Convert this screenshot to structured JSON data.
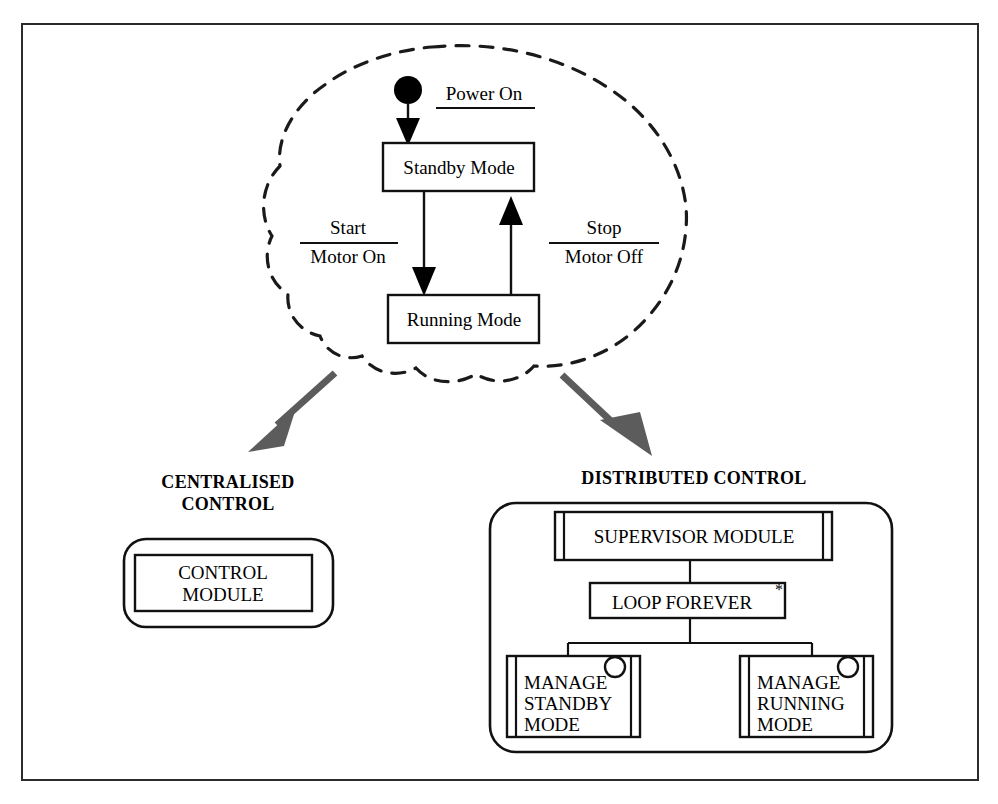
{
  "diagram": {
    "frame": {
      "present": true,
      "color": "#2b2b2b"
    },
    "colors": {
      "line": "#111111",
      "cloud": "#1a1a1a",
      "arrow_gray": "#5c5c5c",
      "background": "#ffffff"
    },
    "statechart": {
      "container_style": "cloud-dashed",
      "initial_node": "filled-circle",
      "states": [
        {
          "id": "standby",
          "label": "Standby Mode"
        },
        {
          "id": "running",
          "label": "Running Mode"
        }
      ],
      "transitions": [
        {
          "id": "power-on",
          "from": "initial",
          "to": "standby",
          "trigger": "Power On",
          "action": "",
          "has_rule": true
        },
        {
          "id": "start",
          "from": "standby",
          "to": "running",
          "trigger": "Start",
          "action": "Motor On",
          "has_rule": true
        },
        {
          "id": "stop",
          "from": "running",
          "to": "standby",
          "trigger": "Stop",
          "action": "Motor Off",
          "has_rule": true
        }
      ]
    },
    "branches": [
      {
        "id": "centralised",
        "title_line1": "CENTRALISED",
        "title_line2": "CONTROL",
        "arrow": "down-left",
        "modules": [
          {
            "id": "control-module",
            "line1": "CONTROL",
            "line2": "MODULE",
            "style": "plain-box"
          }
        ]
      },
      {
        "id": "distributed",
        "title_line1": "DISTRIBUTED CONTROL",
        "title_line2": "",
        "arrow": "down-right",
        "modules": [
          {
            "id": "supervisor",
            "label": "SUPERVISOR MODULE",
            "style": "barred-box"
          },
          {
            "id": "loop",
            "label": "LOOP FOREVER",
            "annotation": "*",
            "style": "plain-box"
          },
          {
            "id": "manage-standby",
            "lines": [
              "MANAGE",
              "STANDBY",
              "MODE"
            ],
            "style": "barred-box-with-port"
          },
          {
            "id": "manage-running",
            "lines": [
              "MANAGE",
              "RUNNING",
              "MODE"
            ],
            "style": "barred-box-with-port"
          }
        ]
      }
    ]
  }
}
